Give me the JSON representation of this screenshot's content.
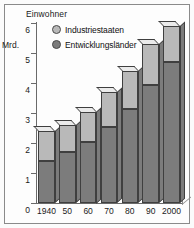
{
  "figure": {
    "title": "Einwohner",
    "y_unit_label": "Mrd."
  },
  "legend": {
    "position": "top-left-inside",
    "items": [
      {
        "label": "Industriestaaten",
        "color": "#b9b9b9",
        "marker": "filled-circle-marker"
      },
      {
        "label": "Entwicklungsländer",
        "color": "#7c7c7c",
        "marker": "filled-circle-marker"
      }
    ]
  },
  "axes": {
    "y_ticks": [
      "0",
      "1",
      "2",
      "3",
      "4",
      "5",
      "6"
    ],
    "x_ticks": [
      "1940",
      "50",
      "60",
      "70",
      "80",
      "90",
      "2000"
    ]
  },
  "chart_data": {
    "type": "bar",
    "stacked": true,
    "title": "Einwohner",
    "xlabel": "",
    "ylabel": "Mrd.",
    "ylim": [
      0,
      6
    ],
    "ytick_values": [
      0,
      1,
      2,
      3,
      4,
      5,
      6
    ],
    "grid": false,
    "legend_position": "upper left (inside plot)",
    "categories": [
      "1940",
      "50",
      "60",
      "70",
      "80",
      "90",
      "2000"
    ],
    "series": [
      {
        "name": "Entwicklungsländer",
        "color": "#7c7c7c",
        "values": [
          1.4,
          1.7,
          2.05,
          2.55,
          3.15,
          3.95,
          4.7
        ]
      },
      {
        "name": "Industriestaaten",
        "color": "#b9b9b9",
        "values": [
          1.0,
          0.9,
          1.0,
          1.15,
          1.25,
          1.35,
          1.2
        ]
      }
    ],
    "totals": [
      2.4,
      2.6,
      3.05,
      3.7,
      4.4,
      5.3,
      5.9
    ],
    "units": "Milliarden Einwohner"
  },
  "colors": {
    "segment_upper": "#b9b9b9",
    "segment_lower": "#7c7c7c",
    "cap_top": "#ebebeb",
    "outline": "#3f3f3f",
    "axis": "#6a6a6a",
    "background": "#fdfdfd",
    "frame": "#8a8a8a"
  }
}
